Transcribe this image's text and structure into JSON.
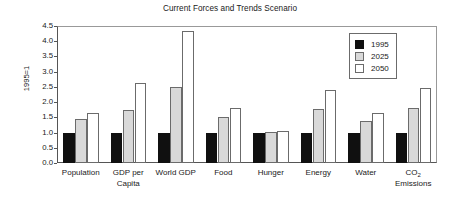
{
  "chart_data": {
    "type": "bar",
    "title": "Current Forces and Trends Scenario",
    "xlabel": "",
    "ylabel": "1995=1",
    "ylim": [
      0.0,
      4.5
    ],
    "ytick_labels": [
      "4.5",
      "4.0",
      "3.5",
      "3.0",
      "2.5",
      "2.0",
      "1.5",
      "1.0",
      "0.5",
      "0.0"
    ],
    "ytick_values": [
      4.5,
      4.0,
      3.5,
      3.0,
      2.5,
      2.0,
      1.5,
      1.0,
      0.5,
      0.0
    ],
    "grid": false,
    "legend_position": "top-right",
    "categories": [
      "Population",
      "GDP per Capita",
      "World GDP",
      "Food",
      "Hunger",
      "Energy",
      "Water",
      "CO2 Emissions"
    ],
    "category_labels_html": [
      "Population",
      "GDP per<br>Capita",
      "World GDP",
      "Food",
      "Hunger",
      "Energy",
      "Water",
      "CO<sub>2</sub><br>Emissions"
    ],
    "series": [
      {
        "name": "1995",
        "color": "#101010",
        "values": [
          1.0,
          1.0,
          1.0,
          1.0,
          1.0,
          1.0,
          1.0,
          1.0
        ]
      },
      {
        "name": "2025",
        "color": "#d9d9d9",
        "values": [
          1.43,
          1.74,
          2.5,
          1.5,
          1.02,
          1.77,
          1.38,
          1.82
        ]
      },
      {
        "name": "2050",
        "color": "#ffffff",
        "values": [
          1.65,
          2.62,
          4.35,
          1.8,
          1.06,
          2.41,
          1.65,
          2.47
        ]
      }
    ]
  },
  "legend": {
    "items": [
      {
        "label": "1995",
        "series_class": "s1995"
      },
      {
        "label": "2025",
        "series_class": "s2025"
      },
      {
        "label": "2050",
        "series_class": "s2050"
      }
    ]
  }
}
